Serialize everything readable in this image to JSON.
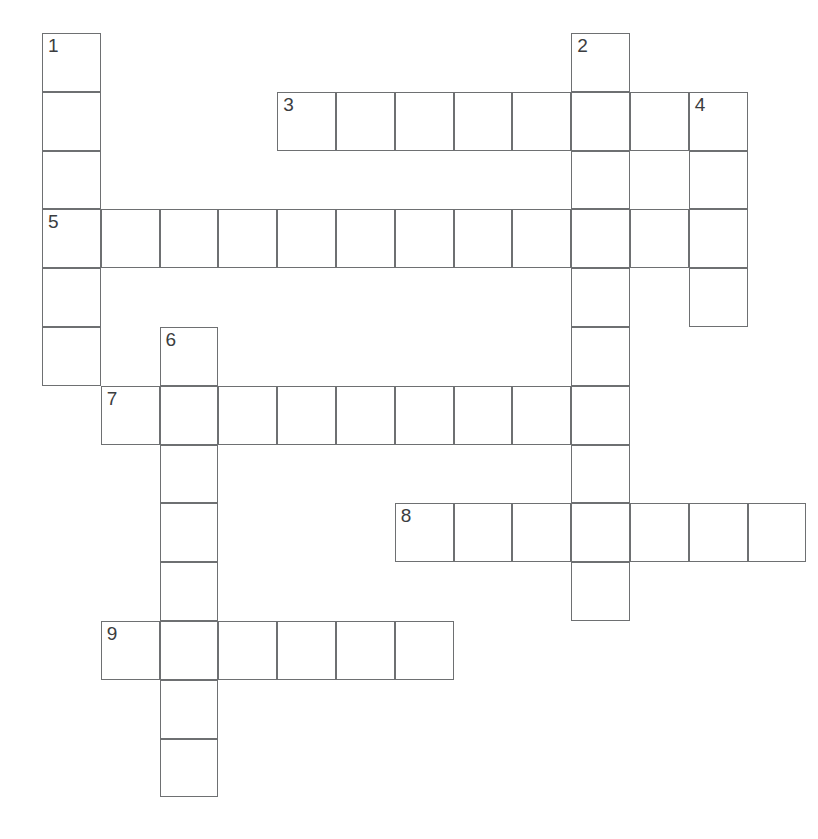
{
  "puzzle": {
    "kind": "crossword-grid",
    "title": "",
    "geometry": {
      "origin_x": 42,
      "origin_y": 33,
      "cell_size": 58.8,
      "columns": 13,
      "rows": 14,
      "line_color": "#6e7072",
      "cell_fill": "#ffffff",
      "page_background": "#ffffff",
      "number_color": "#3b3d40"
    },
    "entries": [
      {
        "number": "1",
        "direction": "down",
        "row": 0,
        "col": 0,
        "length": 6,
        "answer": ""
      },
      {
        "number": "2",
        "direction": "down",
        "row": 0,
        "col": 9,
        "length": 10,
        "answer": ""
      },
      {
        "number": "3",
        "direction": "across",
        "row": 1,
        "col": 4,
        "length": 8,
        "answer": ""
      },
      {
        "number": "4",
        "direction": "down",
        "row": 1,
        "col": 11,
        "length": 4,
        "answer": ""
      },
      {
        "number": "5",
        "direction": "across",
        "row": 3,
        "col": 0,
        "length": 12,
        "answer": ""
      },
      {
        "number": "6",
        "direction": "down",
        "row": 5,
        "col": 2,
        "length": 8,
        "answer": ""
      },
      {
        "number": "7",
        "direction": "across",
        "row": 6,
        "col": 1,
        "length": 9,
        "answer": ""
      },
      {
        "number": "8",
        "direction": "across",
        "row": 8,
        "col": 6,
        "length": 7,
        "answer": ""
      },
      {
        "number": "9",
        "direction": "across",
        "row": 10,
        "col": 1,
        "length": 6,
        "answer": ""
      }
    ],
    "cells": [
      {
        "row": 0,
        "col": 0,
        "number": "1"
      },
      {
        "row": 1,
        "col": 0,
        "number": ""
      },
      {
        "row": 2,
        "col": 0,
        "number": ""
      },
      {
        "row": 3,
        "col": 0,
        "number": "5"
      },
      {
        "row": 4,
        "col": 0,
        "number": ""
      },
      {
        "row": 5,
        "col": 0,
        "number": ""
      },
      {
        "row": 0,
        "col": 9,
        "number": "2"
      },
      {
        "row": 1,
        "col": 9,
        "number": ""
      },
      {
        "row": 2,
        "col": 9,
        "number": ""
      },
      {
        "row": 3,
        "col": 9,
        "number": ""
      },
      {
        "row": 4,
        "col": 9,
        "number": ""
      },
      {
        "row": 5,
        "col": 9,
        "number": ""
      },
      {
        "row": 6,
        "col": 9,
        "number": ""
      },
      {
        "row": 7,
        "col": 9,
        "number": ""
      },
      {
        "row": 8,
        "col": 9,
        "number": ""
      },
      {
        "row": 9,
        "col": 9,
        "number": ""
      },
      {
        "row": 1,
        "col": 4,
        "number": "3"
      },
      {
        "row": 1,
        "col": 5,
        "number": ""
      },
      {
        "row": 1,
        "col": 6,
        "number": ""
      },
      {
        "row": 1,
        "col": 7,
        "number": ""
      },
      {
        "row": 1,
        "col": 8,
        "number": ""
      },
      {
        "row": 1,
        "col": 10,
        "number": ""
      },
      {
        "row": 1,
        "col": 11,
        "number": "4"
      },
      {
        "row": 2,
        "col": 11,
        "number": ""
      },
      {
        "row": 3,
        "col": 11,
        "number": ""
      },
      {
        "row": 4,
        "col": 11,
        "number": ""
      },
      {
        "row": 3,
        "col": 1,
        "number": ""
      },
      {
        "row": 3,
        "col": 2,
        "number": ""
      },
      {
        "row": 3,
        "col": 3,
        "number": ""
      },
      {
        "row": 3,
        "col": 4,
        "number": ""
      },
      {
        "row": 3,
        "col": 5,
        "number": ""
      },
      {
        "row": 3,
        "col": 6,
        "number": ""
      },
      {
        "row": 3,
        "col": 7,
        "number": ""
      },
      {
        "row": 3,
        "col": 8,
        "number": ""
      },
      {
        "row": 3,
        "col": 10,
        "number": ""
      },
      {
        "row": 5,
        "col": 2,
        "number": "6"
      },
      {
        "row": 6,
        "col": 2,
        "number": ""
      },
      {
        "row": 7,
        "col": 2,
        "number": ""
      },
      {
        "row": 8,
        "col": 2,
        "number": ""
      },
      {
        "row": 9,
        "col": 2,
        "number": ""
      },
      {
        "row": 10,
        "col": 2,
        "number": ""
      },
      {
        "row": 11,
        "col": 2,
        "number": ""
      },
      {
        "row": 12,
        "col": 2,
        "number": ""
      },
      {
        "row": 6,
        "col": 1,
        "number": "7"
      },
      {
        "row": 6,
        "col": 3,
        "number": ""
      },
      {
        "row": 6,
        "col": 4,
        "number": ""
      },
      {
        "row": 6,
        "col": 5,
        "number": ""
      },
      {
        "row": 6,
        "col": 6,
        "number": ""
      },
      {
        "row": 6,
        "col": 7,
        "number": ""
      },
      {
        "row": 6,
        "col": 8,
        "number": ""
      },
      {
        "row": 8,
        "col": 6,
        "number": "8"
      },
      {
        "row": 8,
        "col": 7,
        "number": ""
      },
      {
        "row": 8,
        "col": 8,
        "number": ""
      },
      {
        "row": 8,
        "col": 10,
        "number": ""
      },
      {
        "row": 8,
        "col": 11,
        "number": ""
      },
      {
        "row": 8,
        "col": 12,
        "number": ""
      },
      {
        "row": 10,
        "col": 1,
        "number": "9"
      },
      {
        "row": 10,
        "col": 3,
        "number": ""
      },
      {
        "row": 10,
        "col": 4,
        "number": ""
      },
      {
        "row": 10,
        "col": 5,
        "number": ""
      },
      {
        "row": 10,
        "col": 6,
        "number": ""
      }
    ]
  }
}
